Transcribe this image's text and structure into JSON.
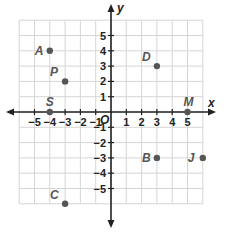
{
  "chart_data": {
    "type": "scatter",
    "title": "",
    "xlabel": "x",
    "ylabel": "y",
    "origin_label": "O",
    "xlim": [
      -6,
      6
    ],
    "ylim": [
      -6,
      6
    ],
    "grid": true,
    "x_tick_labels": [
      "−5",
      "−4",
      "−3",
      "−2",
      "−1",
      "1",
      "2",
      "3",
      "4",
      "5"
    ],
    "x_ticks": [
      -5,
      -4,
      -3,
      -2,
      -1,
      1,
      2,
      3,
      4,
      5
    ],
    "y_tick_labels": [
      "5",
      "4",
      "3",
      "2",
      "1",
      "−1",
      "−2",
      "−3",
      "−4",
      "−5"
    ],
    "y_ticks": [
      5,
      4,
      3,
      2,
      1,
      -1,
      -2,
      -3,
      -4,
      -5
    ],
    "points": [
      {
        "label": "A",
        "x": -4,
        "y": 4
      },
      {
        "label": "P",
        "x": -3,
        "y": 2
      },
      {
        "label": "S",
        "x": -4,
        "y": 0
      },
      {
        "label": "D",
        "x": 3,
        "y": 3
      },
      {
        "label": "M",
        "x": 5,
        "y": 0
      },
      {
        "label": "B",
        "x": 3,
        "y": -3
      },
      {
        "label": "J",
        "x": 6,
        "y": -3
      },
      {
        "label": "C",
        "x": -3,
        "y": -6
      }
    ],
    "colors": {
      "point": "#555555",
      "grid": "#d6d6d6",
      "axis": "#222222"
    }
  }
}
